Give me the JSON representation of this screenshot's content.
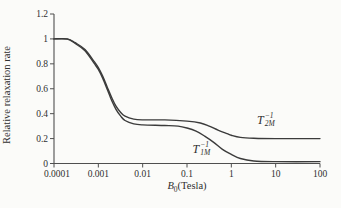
{
  "figure": {
    "background": "#fbfbf9",
    "curve_color": "#3b3b3b",
    "axis_color": "#4f4f4f",
    "text_color": "#2f2f2f"
  },
  "chart_data": {
    "type": "line",
    "x_scale": "log",
    "grid": false,
    "legend_position": "inline-curve-labels",
    "xlim": [
      0.0001,
      100
    ],
    "ylim": [
      0,
      1.2
    ],
    "xlabel": {
      "base": "B",
      "sub": "0",
      "rest": "(Tesla)"
    },
    "ylabel": "Relative relaxation rate",
    "x_tick_values": [
      0.0001,
      0.001,
      0.01,
      0.1,
      1,
      10,
      100
    ],
    "x_tick_labels": [
      "0.0001",
      "0.001",
      "0.01",
      "0.1",
      "1",
      "10",
      "100"
    ],
    "y_tick_values": [
      0,
      0.2,
      0.4,
      0.6,
      0.8,
      1,
      1.2
    ],
    "y_tick_labels": [
      "0",
      "0.2",
      "0.4",
      "0.6",
      "0.8",
      "1",
      "1.2"
    ],
    "series": [
      {
        "name": "T2M-inverse-relaxation-rate",
        "label": {
          "base": "T",
          "sup": "−1",
          "sub": "2M"
        },
        "label_at": [
          6,
          0.35
        ],
        "points": [
          [
            0.0001,
            1.0
          ],
          [
            0.0002,
            1.0
          ],
          [
            0.0003,
            0.97
          ],
          [
            0.0005,
            0.915
          ],
          [
            0.0008,
            0.82
          ],
          [
            0.001,
            0.77
          ],
          [
            0.00126,
            0.7
          ],
          [
            0.0016,
            0.61
          ],
          [
            0.002,
            0.53
          ],
          [
            0.0025,
            0.46
          ],
          [
            0.0032,
            0.41
          ],
          [
            0.004,
            0.38
          ],
          [
            0.0063,
            0.356
          ],
          [
            0.01,
            0.35
          ],
          [
            0.0316,
            0.35
          ],
          [
            0.1,
            0.34
          ],
          [
            0.2,
            0.325
          ],
          [
            0.316,
            0.3
          ],
          [
            0.5,
            0.268
          ],
          [
            0.8,
            0.24
          ],
          [
            1.0,
            0.227
          ],
          [
            1.6,
            0.21
          ],
          [
            3.2,
            0.203
          ],
          [
            10,
            0.2
          ],
          [
            100,
            0.2
          ]
        ]
      },
      {
        "name": "T1M-inverse-relaxation-rate",
        "label": {
          "base": "T",
          "sup": "−1",
          "sub": "1M"
        },
        "label_at": [
          0.21,
          0.115
        ],
        "points": [
          [
            0.0001,
            1.0
          ],
          [
            0.0002,
            0.998
          ],
          [
            0.0003,
            0.963
          ],
          [
            0.0005,
            0.905
          ],
          [
            0.0008,
            0.805
          ],
          [
            0.001,
            0.755
          ],
          [
            0.00126,
            0.683
          ],
          [
            0.0016,
            0.592
          ],
          [
            0.002,
            0.505
          ],
          [
            0.0025,
            0.435
          ],
          [
            0.0032,
            0.38
          ],
          [
            0.004,
            0.345
          ],
          [
            0.0063,
            0.318
          ],
          [
            0.01,
            0.31
          ],
          [
            0.0316,
            0.305
          ],
          [
            0.063,
            0.3
          ],
          [
            0.1,
            0.285
          ],
          [
            0.16,
            0.26
          ],
          [
            0.25,
            0.22
          ],
          [
            0.4,
            0.17
          ],
          [
            0.63,
            0.114
          ],
          [
            1.0,
            0.073
          ],
          [
            1.6,
            0.04
          ],
          [
            3.2,
            0.02
          ],
          [
            10,
            0.015
          ],
          [
            100,
            0.015
          ]
        ]
      }
    ]
  }
}
